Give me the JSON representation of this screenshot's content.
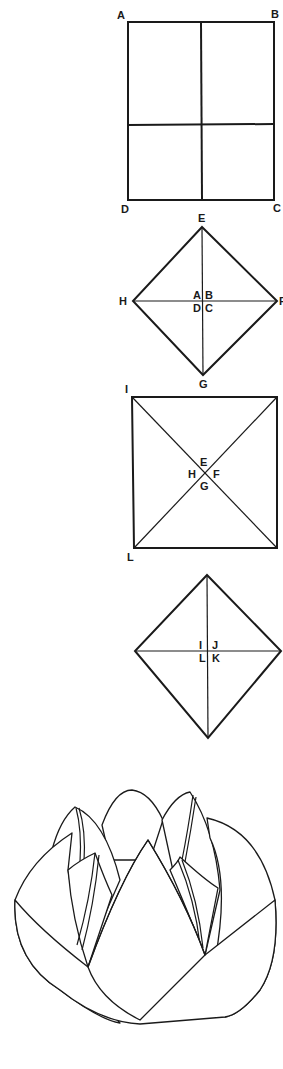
{
  "steps": [
    {
      "name": "square-with-folds",
      "labels": {
        "top_left": "A",
        "top_right": "B",
        "bottom_right": "C",
        "bottom_left": "D"
      }
    },
    {
      "name": "diamond-corners-folded-to-center",
      "labels": {
        "top": "E",
        "left": "H",
        "right": "F",
        "bottom": "G",
        "center_tl": "A",
        "center_tr": "B",
        "center_bl": "D",
        "center_br": "C"
      }
    },
    {
      "name": "square-with-diagonals",
      "labels": {
        "top_left": "I",
        "bottom_left": "L",
        "center_top": "E",
        "center_left": "H",
        "center_right": "F",
        "center_bottom": "G"
      }
    },
    {
      "name": "diamond-second-fold",
      "labels": {
        "center_tl": "I",
        "center_tr": "J",
        "center_bl": "L",
        "center_br": "K"
      }
    },
    {
      "name": "finished-lotus",
      "labels": {}
    }
  ],
  "colors": {
    "line": "#1a1a1a",
    "background": "#ffffff"
  }
}
